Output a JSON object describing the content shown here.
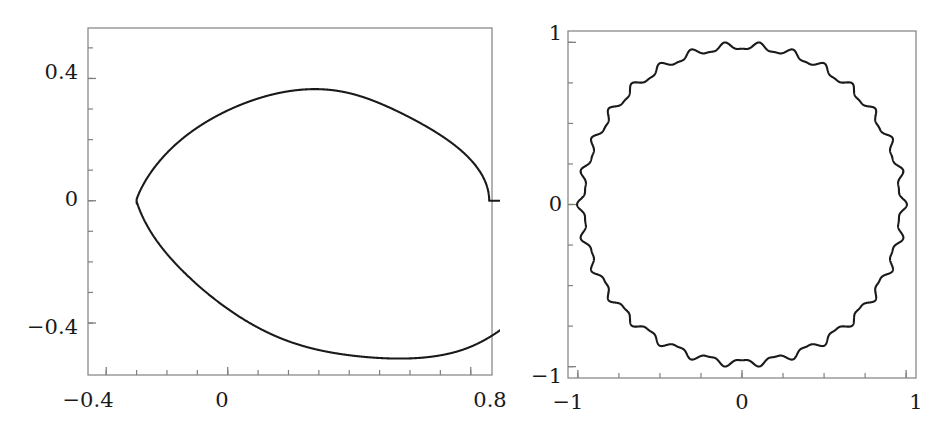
{
  "figure": {
    "background_color": "#ffffff",
    "curve_color": "#1a1a1a",
    "axis_color": "#808080",
    "panel_count": 2
  },
  "chart_data": [
    {
      "type": "line",
      "name": "left-panel",
      "title": "",
      "xlabel": "",
      "ylabel": "",
      "grid": false,
      "legend": null,
      "xlim": [
        -0.46,
        0.87
      ],
      "ylim": [
        -0.57,
        0.565
      ],
      "xticks": [
        -0.4,
        0.0,
        0.8
      ],
      "xtick_labels": [
        "−0.4",
        "0",
        "0.8"
      ],
      "yticks": [
        -0.4,
        0.0,
        0.4
      ],
      "ytick_labels": [
        "−0.4",
        "0",
        "0.4"
      ],
      "minor_xticks": [
        -0.4,
        -0.3,
        -0.2,
        -0.1,
        0.0,
        0.1,
        0.2,
        0.3,
        0.4,
        0.5,
        0.6,
        0.7,
        0.8
      ],
      "minor_yticks": [
        -0.4,
        -0.3,
        -0.2,
        -0.1,
        0.0,
        0.1,
        0.2,
        0.3,
        0.4,
        0.5
      ],
      "description": "closed parametric curve with an outer cardioid-like lobe, a small inner oval, two small teardrop loops and a cusp/crossing near x=-0.30, y=0",
      "features": {
        "x_max": 0.81,
        "y_max": 0.545,
        "y_min": -0.545,
        "cusp_point": [
          -0.3,
          0.0
        ],
        "inner_oval_x_range": [
          -0.3,
          0.06
        ],
        "inner_oval_y_range": [
          -0.18,
          0.19
        ],
        "upper_loop_center": [
          -0.06,
          0.365
        ],
        "lower_loop_center": [
          -0.06,
          -0.365
        ],
        "loop_count": 2
      }
    },
    {
      "type": "line",
      "name": "right-panel",
      "title": "",
      "xlabel": "",
      "ylabel": "",
      "grid": false,
      "legend": null,
      "xlim": [
        -1.06,
        1.06
      ],
      "ylim": [
        -1.07,
        1.07
      ],
      "xticks": [
        -1,
        0,
        1
      ],
      "xtick_labels": [
        "−1",
        "0",
        "1"
      ],
      "yticks": [
        -1,
        0,
        1
      ],
      "ytick_labels": [
        "−1",
        "0",
        "1"
      ],
      "minor_xticks": [
        -1,
        -0.75,
        -0.5,
        -0.25,
        0,
        0.25,
        0.5,
        0.75,
        1
      ],
      "minor_yticks": [
        -1,
        -0.75,
        -0.5,
        -0.25,
        0,
        0.25,
        0.5,
        0.75,
        1
      ],
      "description": "near-unit circle with a small high-frequency ripple superimposed on the radius",
      "features": {
        "base_radius": 0.975,
        "ripple_amplitude": 0.022,
        "ripple_count": 30
      }
    }
  ],
  "left_panel": {
    "x_labels": [
      "−0.4",
      "0",
      "0.8"
    ],
    "y_labels": [
      "0.4",
      "0",
      "−0.4"
    ]
  },
  "right_panel": {
    "x_labels": [
      "−1",
      "0",
      "1"
    ],
    "y_labels": [
      "1",
      "0",
      "−1"
    ]
  }
}
